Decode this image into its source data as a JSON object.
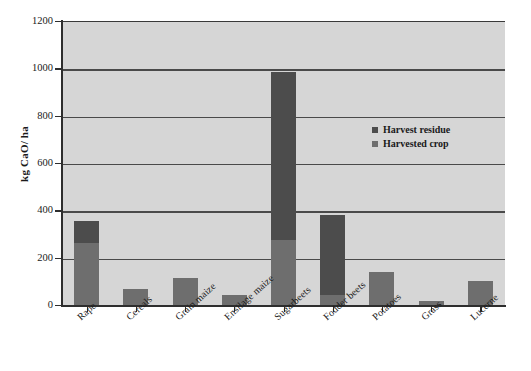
{
  "chart_data": {
    "type": "bar",
    "stacked": true,
    "title": "",
    "xlabel": "",
    "ylabel": "kg CaO/ ha",
    "ylim": [
      0,
      1200
    ],
    "yticks": [
      0,
      200,
      400,
      600,
      800,
      1000,
      1200
    ],
    "ytick_labels": [
      "0",
      "200",
      "400",
      "600",
      "800",
      "1000",
      "1200"
    ],
    "grid": true,
    "legend_position": "inside-right",
    "categories": [
      "Rape",
      "Cereals",
      "Grain maize",
      "Ensilage maize",
      "Sugarbeets",
      "Fodder beets",
      "Potatoes",
      "Grass",
      "Lucerne"
    ],
    "series": [
      {
        "name": "Harvested crop",
        "color": "#6e6e6e",
        "values": [
          265,
          70,
          120,
          45,
          280,
          45,
          142,
          22,
          105
        ]
      },
      {
        "name": "Harvest residue",
        "color": "#4c4c4c",
        "values": [
          95,
          0,
          0,
          0,
          710,
          340,
          0,
          0,
          0
        ]
      }
    ],
    "totals": [
      360,
      70,
      120,
      45,
      990,
      385,
      142,
      22,
      105
    ]
  },
  "axis": {
    "y_title": "kg CaO/ ha"
  },
  "legend": {
    "items": [
      {
        "label": "Harvest residue",
        "color": "#4c4c4c"
      },
      {
        "label": "Harvested crop",
        "color": "#6e6e6e"
      }
    ]
  },
  "colors": {
    "plot_background": "#d6d6d6",
    "gridline": "#4a4a4a",
    "axis": "#2e2e2e",
    "text": "#1a1a1a",
    "harvest_residue": "#4c4c4c",
    "harvested_crop": "#6e6e6e"
  }
}
